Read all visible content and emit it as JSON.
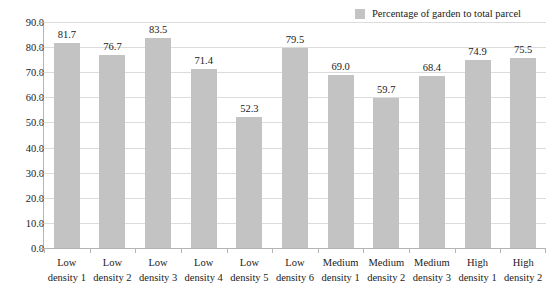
{
  "chart_data": {
    "type": "bar",
    "title": "",
    "subtitle": "",
    "xlabel": "",
    "ylabel": "",
    "ylim": [
      0,
      90
    ],
    "ytick_step": 10,
    "ytick_labels": [
      "90.0",
      "80.0",
      "70.0",
      "60.0",
      "50.0",
      "40.0",
      "30.0",
      "20.0",
      "10.0",
      "0.0"
    ],
    "grid": true,
    "legend_position": "top-right",
    "categories": [
      "Low density 1",
      "Low density 2",
      "Low density 3",
      "Low density 4",
      "Low density 5",
      "Low density 6",
      "Medium density 1",
      "Medium density 2",
      "Medium density 3",
      "High density 1",
      "High density 2"
    ],
    "category_lines": [
      [
        "Low",
        "density 1"
      ],
      [
        "Low",
        "density 2"
      ],
      [
        "Low",
        "density 3"
      ],
      [
        "Low",
        "density 4"
      ],
      [
        "Low",
        "density 5"
      ],
      [
        "Low",
        "density 6"
      ],
      [
        "Medium",
        "density 1"
      ],
      [
        "Medium",
        "density 2"
      ],
      [
        "Medium",
        "density 3"
      ],
      [
        "High",
        "density 1"
      ],
      [
        "High",
        "density 2"
      ]
    ],
    "series": [
      {
        "name": "Percentage of garden to total parcel",
        "color": "#c3c3c3",
        "values": [
          81.7,
          76.7,
          83.5,
          71.4,
          52.3,
          79.5,
          69.0,
          59.7,
          68.4,
          74.9,
          75.5
        ],
        "value_labels": [
          "81.7",
          "76.7",
          "83.5",
          "71.4",
          "52.3",
          "79.5",
          "69.0",
          "59.7",
          "68.4",
          "74.9",
          "75.5"
        ]
      }
    ]
  },
  "legend": {
    "items": [
      {
        "label": "Percentage of garden to total parcel",
        "color": "#c3c3c3"
      }
    ]
  },
  "colors": {
    "bar": "#c3c3c3",
    "gridline": "#dcdcdc",
    "axis": "#b5b5b5",
    "text": "#1a1a1a",
    "background": "#ffffff"
  }
}
